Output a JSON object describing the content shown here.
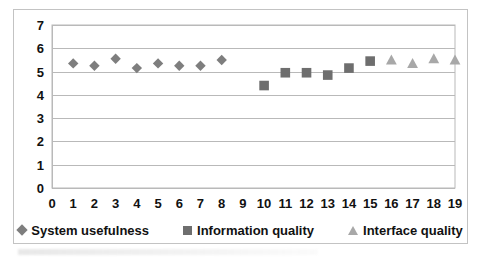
{
  "chart_data": {
    "type": "scatter",
    "title": "",
    "subtitle": "",
    "xlabel": "",
    "ylabel": "",
    "xlim": [
      0,
      19
    ],
    "ylim": [
      0,
      7
    ],
    "grid": true,
    "grid_axis": "y",
    "legend_position": "bottom",
    "x_ticks": [
      "0",
      "1",
      "2",
      "3",
      "4",
      "5",
      "6",
      "7",
      "8",
      "9",
      "10",
      "11",
      "12",
      "13",
      "14",
      "15",
      "16",
      "17",
      "18",
      "19"
    ],
    "y_ticks": [
      "0",
      "1",
      "2",
      "3",
      "4",
      "5",
      "6",
      "7"
    ],
    "series": [
      {
        "name": "System usefulness",
        "marker": "diamond",
        "color": "#7e7e7e",
        "x": [
          1,
          2,
          3,
          4,
          5,
          6,
          7,
          8
        ],
        "values": [
          5.35,
          5.25,
          5.55,
          5.15,
          5.35,
          5.25,
          5.25,
          5.5
        ]
      },
      {
        "name": "Information quality",
        "marker": "square",
        "color": "#6e6e6e",
        "x": [
          10,
          11,
          12,
          13,
          14,
          15
        ],
        "values": [
          4.4,
          4.95,
          4.95,
          4.85,
          5.15,
          5.45
        ]
      },
      {
        "name": "Interface quality",
        "marker": "triangle",
        "color": "#a8a8a8",
        "x": [
          16,
          17,
          18,
          19
        ],
        "values": [
          5.5,
          5.35,
          5.55,
          5.5
        ]
      }
    ]
  },
  "legend": {
    "entries": [
      {
        "label": "System usefulness",
        "marker": "diamond-marker",
        "color": "#7e7e7e"
      },
      {
        "label": "Information quality",
        "marker": "square-marker",
        "color": "#6e6e6e"
      },
      {
        "label": "Interface quality",
        "marker": "triangle-marker",
        "color": "#a8a8a8"
      }
    ]
  },
  "style": {
    "grid_color": "#b9b9b9",
    "frame_color": "#c3c3c3",
    "plot_border_color": "#b9b9b9",
    "background": "#ffffff",
    "tick_text_color": "#111111"
  }
}
